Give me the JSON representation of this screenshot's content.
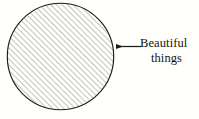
{
  "figure": {
    "type": "hatched-circle-with-callout",
    "background_color": "#fffffc",
    "outline_color": "#1a1a1a",
    "hatch_color": "#8a8a85",
    "text_color": "#131313",
    "circle": {
      "name": "hatched-circle",
      "center_x": 60.5,
      "center_y": 56.5,
      "radius": 53.5,
      "fill": "diagonal-hatch",
      "hatch_angle_degrees": 45,
      "hatch_spacing_px": 4,
      "stroke_width": 1.1
    },
    "callout": {
      "name": "leader-arrow",
      "direction": "left",
      "tip_x": 114,
      "tip_y": 46.5,
      "tail_x": 141,
      "tail_y": 46.5,
      "stroke_width": 1.2
    },
    "label": {
      "name": "callout-label",
      "lines": [
        "Beautiful",
        "things"
      ],
      "line_1": "Beautiful",
      "line_2": "things",
      "full_text": "Beautiful things",
      "font_size_px": 12.5
    }
  }
}
